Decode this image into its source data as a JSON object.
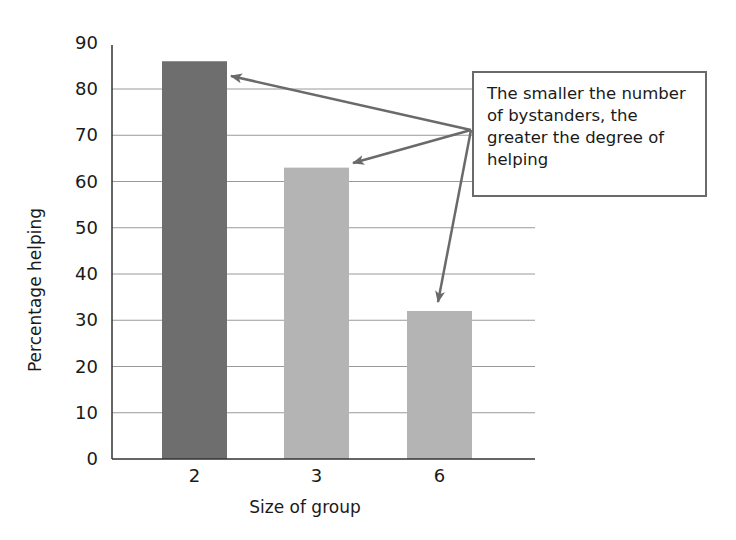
{
  "chart_data": {
    "type": "bar",
    "title": "",
    "xlabel": "Size of group",
    "ylabel": "Percentage helping",
    "categories": [
      "2",
      "3",
      "6"
    ],
    "values": [
      86,
      63,
      32
    ],
    "ylim": [
      0,
      90
    ],
    "yticks": [
      0,
      10,
      20,
      30,
      40,
      50,
      60,
      70,
      80,
      90
    ],
    "grid": true,
    "legend": null,
    "bar_colors": [
      "#6e6e6e",
      "#b4b4b4",
      "#b4b4b4"
    ],
    "annotations": [
      {
        "text": "The smaller the number of bystanders, the greater the degree of helping",
        "arrows_to_categories": [
          "2",
          "3",
          "6"
        ]
      }
    ]
  },
  "labels": {
    "xlabel": "Size of group",
    "ylabel": "Percentage helping",
    "callout_line1": "The smaller the number",
    "callout_line2": "of bystanders, the",
    "callout_line3": "greater the degree of",
    "callout_line4": "helping"
  },
  "ticks": {
    "y": [
      "0",
      "10",
      "20",
      "30",
      "40",
      "50",
      "60",
      "70",
      "80",
      "90"
    ],
    "x": [
      "2",
      "3",
      "6"
    ]
  }
}
